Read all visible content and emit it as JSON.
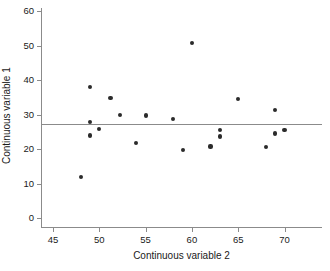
{
  "chart_data": {
    "type": "scatter",
    "title": "",
    "xlabel": "Continuous variable 2",
    "ylabel": "Continuous variable 1",
    "xlim": [
      43.5,
      71.5
    ],
    "ylim": [
      -3,
      62
    ],
    "xticks": [
      45,
      50,
      55,
      60,
      65,
      70
    ],
    "yticks": [
      0,
      10,
      20,
      30,
      40,
      50,
      60
    ],
    "xtick_labels": [
      "45",
      "50",
      "55",
      "60",
      "65",
      "70"
    ],
    "ytick_labels": [
      "0",
      "10",
      "20",
      "30",
      "40",
      "50",
      "60"
    ],
    "grid": false,
    "legend": null,
    "points": [
      {
        "x": 48.0,
        "y": 11.9
      },
      {
        "x": 49.0,
        "y": 38.0
      },
      {
        "x": 49.0,
        "y": 27.8
      },
      {
        "x": 49.0,
        "y": 23.9
      },
      {
        "x": 50.0,
        "y": 25.8
      },
      {
        "x": 51.2,
        "y": 34.8
      },
      {
        "x": 52.2,
        "y": 29.8
      },
      {
        "x": 54.0,
        "y": 21.8
      },
      {
        "x": 55.0,
        "y": 29.7
      },
      {
        "x": 58.0,
        "y": 28.7
      },
      {
        "x": 59.0,
        "y": 19.7
      },
      {
        "x": 60.0,
        "y": 50.8
      },
      {
        "x": 62.0,
        "y": 20.7
      },
      {
        "x": 63.0,
        "y": 25.6
      },
      {
        "x": 63.0,
        "y": 23.6
      },
      {
        "x": 65.0,
        "y": 34.5
      },
      {
        "x": 68.0,
        "y": 20.6
      },
      {
        "x": 69.0,
        "y": 31.4
      },
      {
        "x": 69.0,
        "y": 24.5
      },
      {
        "x": 70.0,
        "y": 25.5
      }
    ],
    "reference_line": {
      "orientation": "horizontal",
      "y": 27.3,
      "x_start": 43.5,
      "x_end": 71.5,
      "color": "#8b8b8b"
    },
    "colors": {
      "marker": "#2b2b2b",
      "axis": "#8b8b8b",
      "text": "#1a1a1a",
      "background": "#ffffff"
    }
  }
}
